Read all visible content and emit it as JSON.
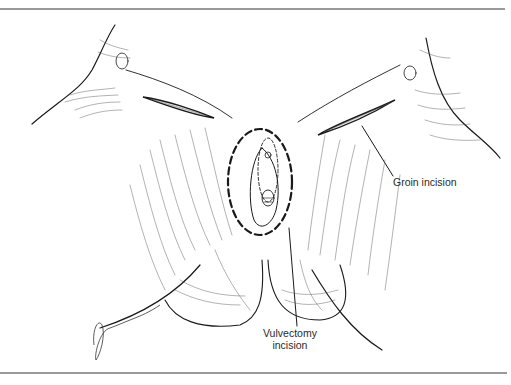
{
  "figure": {
    "labels": {
      "groin": "Groin incision",
      "vulvectomy_line1": "Vulvectomy",
      "vulvectomy_line2": "incision"
    },
    "signature": "Glasgow",
    "colors": {
      "ink": "#1a1a1a",
      "hatch": "#555555",
      "rule": "#9a9a9a",
      "background": "#ffffff"
    }
  }
}
